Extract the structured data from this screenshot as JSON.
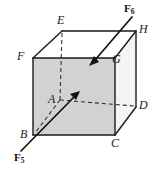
{
  "figure": {
    "kind": "cube-force-diagram",
    "width": 158,
    "height": 175,
    "background_color": "#ffffff",
    "front_face_fill": "#d2d2d2",
    "top_face_fill": "#ffffff",
    "right_face_fill": "#f2f2f2",
    "edge_color": "#1a1a1a",
    "hidden_edge_style": "dashed",
    "arrow_color": "#111111"
  },
  "vertices": [
    {
      "id": "A",
      "label": "A",
      "x": 60,
      "y": 100,
      "hidden": true
    },
    {
      "id": "B",
      "label": "B",
      "x": 33,
      "y": 135,
      "hidden": false
    },
    {
      "id": "C",
      "label": "C",
      "x": 115,
      "y": 135,
      "hidden": false
    },
    {
      "id": "D",
      "label": "D",
      "x": 136,
      "y": 107,
      "hidden": false
    },
    {
      "id": "E",
      "label": "E",
      "x": 62,
      "y": 31,
      "hidden": false
    },
    {
      "id": "F",
      "label": "F",
      "x": 33,
      "y": 58,
      "hidden": false
    },
    {
      "id": "G",
      "label": "G",
      "x": 115,
      "y": 58,
      "hidden": false
    },
    {
      "id": "H",
      "label": "H",
      "x": 136,
      "y": 31,
      "hidden": false
    }
  ],
  "vertex_labels": [
    {
      "name": "vertex-label-a",
      "text": "A",
      "left": 48,
      "top": 94
    },
    {
      "name": "vertex-label-b",
      "text": "B",
      "left": 20,
      "top": 130
    },
    {
      "name": "vertex-label-c",
      "text": "C",
      "left": 112,
      "top": 138
    },
    {
      "name": "vertex-label-d",
      "text": "D",
      "left": 139,
      "top": 100
    },
    {
      "name": "vertex-label-e",
      "text": "E",
      "left": 57,
      "top": 14
    },
    {
      "name": "vertex-label-f",
      "text": "F",
      "left": 17,
      "top": 51
    },
    {
      "name": "vertex-label-g",
      "text": "G",
      "left": 112,
      "top": 54
    },
    {
      "name": "vertex-label-h",
      "text": "H",
      "left": 139,
      "top": 24
    }
  ],
  "forces": [
    {
      "id": "F5",
      "base": "F",
      "subscript": "5",
      "label_left": 14,
      "label_top": 153,
      "tail_x": 21,
      "tail_y": 151,
      "head_x": 79,
      "head_y": 92,
      "description": "force arrow pointing up and to the right toward hidden vertex A"
    },
    {
      "id": "F6",
      "base": "F",
      "subscript": "6",
      "label_left": 124,
      "label_top": 4,
      "tail_x": 132,
      "tail_y": 17,
      "head_x": 90,
      "head_y": 65,
      "description": "force arrow pointing down and to the left toward vertex G"
    }
  ]
}
